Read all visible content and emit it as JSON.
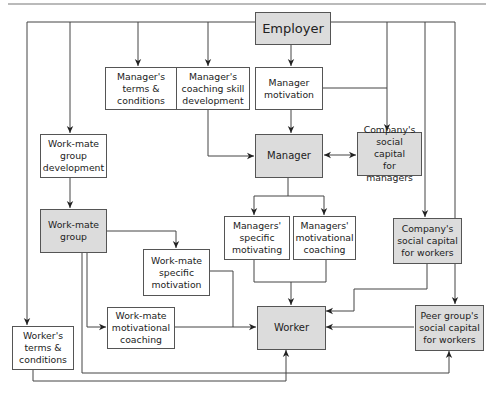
{
  "diagram": {
    "type": "flow-diagram",
    "colors": {
      "shaded_fill": "#dcdcdc",
      "plain_fill": "#ffffff",
      "line": "#444444",
      "text": "#222222"
    },
    "nodes": {
      "employer": {
        "label": "Employer",
        "shaded": true
      },
      "manager_terms": {
        "label": "Manager's\nterms &\nconditions",
        "shaded": false
      },
      "manager_coaching_skill": {
        "label": "Manager's\ncoaching skill\ndevelopment",
        "shaded": false
      },
      "manager_motivation": {
        "label": "Manager\nmotivation",
        "shaded": false
      },
      "manager": {
        "label": "Manager",
        "shaded": true
      },
      "company_social_capital_managers": {
        "label": "Company's\nsocial capital\nfor managers",
        "shaded": true
      },
      "workmate_group_development": {
        "label": "Work-mate\ngroup\ndevelopment",
        "shaded": false
      },
      "workmate_group": {
        "label": "Work-mate\ngroup",
        "shaded": true
      },
      "managers_specific_motivating": {
        "label": "Managers'\nspecific\nmotivating",
        "shaded": false
      },
      "managers_motivational_coaching": {
        "label": "Managers'\nmotivational\ncoaching",
        "shaded": false
      },
      "company_social_capital_workers": {
        "label": "Company's\nsocial capital\nfor workers",
        "shaded": true
      },
      "workmate_specific_motivation": {
        "label": "Work-mate\nspecific\nmotivation",
        "shaded": false
      },
      "workmate_motivational_coaching": {
        "label": "Work-mate\nmotivational\ncoaching",
        "shaded": false
      },
      "worker": {
        "label": "Worker",
        "shaded": true
      },
      "peer_group_social_capital": {
        "label": "Peer group's\nsocial capital\nfor workers",
        "shaded": true
      },
      "worker_terms": {
        "label": "Worker's\nterms &\nconditions",
        "shaded": false
      }
    },
    "edges": [
      {
        "from": "Employer",
        "to": "Manager's terms & conditions"
      },
      {
        "from": "Employer",
        "to": "Manager's coaching skill development"
      },
      {
        "from": "Employer",
        "to": "Manager motivation"
      },
      {
        "from": "Employer",
        "to": "Company's social capital for managers"
      },
      {
        "from": "Employer",
        "to": "Company's social capital for workers"
      },
      {
        "from": "Employer",
        "to": "Peer group's social capital for workers"
      },
      {
        "from": "Employer",
        "to": "Work-mate group development"
      },
      {
        "from": "Employer",
        "to": "Worker's terms & conditions"
      },
      {
        "from": "Manager motivation",
        "to": "Manager"
      },
      {
        "from": "Manager motivation",
        "to": "Company's social capital for managers"
      },
      {
        "from": "Manager's coaching skill development",
        "to": "Manager"
      },
      {
        "from": "Manager",
        "to": "Company's social capital for managers",
        "bidirectional": true
      },
      {
        "from": "Manager",
        "to": "Managers' specific motivating"
      },
      {
        "from": "Manager",
        "to": "Managers' motivational coaching"
      },
      {
        "from": "Work-mate group development",
        "to": "Work-mate group"
      },
      {
        "from": "Work-mate group",
        "to": "Work-mate specific motivation"
      },
      {
        "from": "Work-mate group",
        "to": "Work-mate motivational coaching"
      },
      {
        "from": "Work-mate group",
        "to": "Peer group's social capital for workers"
      },
      {
        "from": "Work-mate specific motivation",
        "to": "Worker"
      },
      {
        "from": "Work-mate motivational coaching",
        "to": "Worker"
      },
      {
        "from": "Managers' specific motivating",
        "to": "Worker"
      },
      {
        "from": "Managers' motivational coaching",
        "to": "Worker"
      },
      {
        "from": "Company's social capital for workers",
        "to": "Worker"
      },
      {
        "from": "Peer group's social capital for workers",
        "to": "Worker"
      },
      {
        "from": "Worker's terms & conditions",
        "to": "Worker"
      }
    ]
  }
}
